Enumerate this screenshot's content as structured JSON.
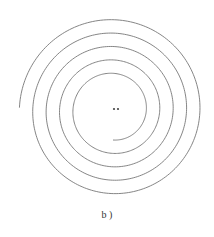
{
  "figure": {
    "caption": "b )",
    "type": "archimedean-spiral",
    "stroke_color": "#777777",
    "center": {
      "x": 113,
      "y": 110
    },
    "start_radius": 30,
    "growth_per_turn": 13.4,
    "turns": 4.75,
    "center_marker": "••"
  }
}
